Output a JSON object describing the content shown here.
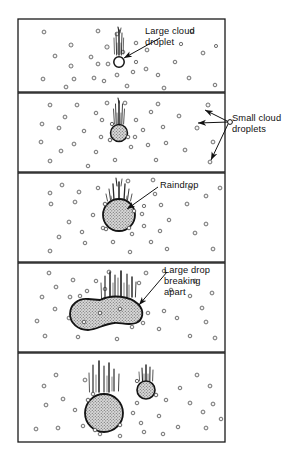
{
  "figure": {
    "panel_count": 5,
    "frame_color": "#1a1a1a",
    "droplet_outline_color": "#2a2a2a",
    "droplet_fill_color": "#b9b9b9",
    "background_color": "#ffffff",
    "text_color": "#111111"
  },
  "labels": {
    "large_cloud_droplet": "Large cloud\ndroplet",
    "small_cloud_droplets": "Small cloud\ndroplets",
    "raindrop": "Raindrop",
    "large_drop_breaking_apart": "Large drop\nbreaking\napart"
  },
  "panels": [
    {
      "index": 1,
      "name": "panel-1-large-cloud-droplet",
      "label": "Large cloud droplet",
      "main_drop": {
        "shape": "circle",
        "cx": 119,
        "cy": 62,
        "r": 5.2,
        "filled": false
      },
      "small_droplet_count": 34
    },
    {
      "index": 2,
      "name": "panel-2-small-cloud-droplets",
      "label": "Small cloud droplets",
      "main_drop": {
        "shape": "circle",
        "cx": 119,
        "cy": 133,
        "r": 8.5,
        "filled": true
      },
      "small_droplet_count": 34
    },
    {
      "index": 3,
      "name": "panel-3-raindrop",
      "label": "Raindrop",
      "main_drop": {
        "shape": "circle",
        "cx": 119,
        "cy": 215,
        "r": 16,
        "filled": true
      },
      "small_droplet_count": 36
    },
    {
      "index": 4,
      "name": "panel-4-large-drop-breaking-apart",
      "label": "Large drop breaking apart",
      "main_drop": {
        "shape": "peanut",
        "cx": 118,
        "cy": 312,
        "filled": true
      },
      "small_droplet_count": 36
    },
    {
      "index": 5,
      "name": "panel-5-drops-after-breakup",
      "label": "",
      "main_drop": {
        "shape": "circle",
        "cx": 104,
        "cy": 413,
        "r": 19,
        "filled": true
      },
      "secondary_drop": {
        "shape": "circle",
        "cx": 146,
        "cy": 390,
        "r": 9,
        "filled": true
      },
      "small_droplet_count": 28
    }
  ]
}
